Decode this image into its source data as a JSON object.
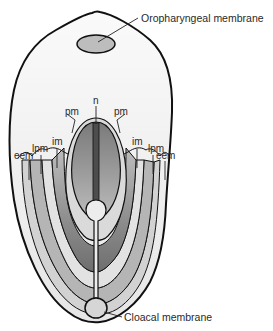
{
  "diagram": {
    "labels": {
      "oropharyngeal_membrane": "Oropharyngeal membrane",
      "cloacal_membrane": "Cloacal membrane",
      "notochord": "n",
      "paraxial_mesoderm_left": "pm",
      "paraxial_mesoderm_right": "pm",
      "intermediate_mesoderm_left": "im",
      "intermediate_mesoderm_right": "im",
      "lateral_plate_mesoderm_left": "lpm",
      "lateral_plate_mesoderm_right": "lpm",
      "extraembryonic_mesoderm_left": "eem",
      "extraembryonic_mesoderm_right": "eem"
    },
    "colors": {
      "outline": "#111111",
      "disc_fill": "#f1f1f1",
      "membrane_fill": "#bdbdbd",
      "pm_fill": "#8a8a8a",
      "im_fill": "#bcbcbc",
      "lpm_fill": "#9a9a9a",
      "eem_fill": "#cfcfcf",
      "notochord_fill": "#555555",
      "neural_plate_fill": "#d4d4d4"
    }
  }
}
